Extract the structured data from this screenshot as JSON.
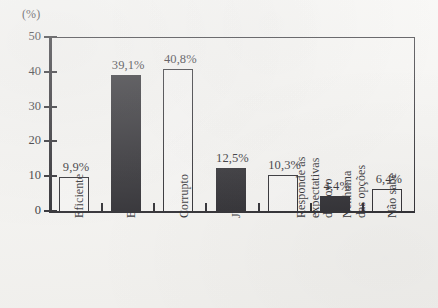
{
  "chart_data": {
    "type": "bar",
    "title": "",
    "xlabel": "",
    "ylabel": "(%)",
    "ylim": [
      0,
      50
    ],
    "yticks": [
      0,
      10,
      20,
      30,
      40,
      50
    ],
    "grid": false,
    "legend": null,
    "categories": [
      "Eficiente",
      "Burocrático",
      "Corrupto",
      "Justo",
      "Responde às expectativas do povo",
      "Nenhuma das opções",
      "Não sabe"
    ],
    "category_lines": [
      [
        "Eficiente"
      ],
      [
        "Burocrático"
      ],
      [
        "Corrupto"
      ],
      [
        "Justo"
      ],
      [
        "Responde às",
        "expectativas",
        "do povo"
      ],
      [
        "Nenhuma",
        "das opções"
      ],
      [
        "Não sabe"
      ]
    ],
    "values": [
      9.9,
      39.1,
      40.8,
      12.5,
      10.3,
      4.4,
      6.4
    ],
    "value_labels": [
      "9,9%",
      "39,1%",
      "40,8%",
      "12,5%",
      "10,3%",
      "4,4%",
      "6,4%"
    ],
    "bar_fills": [
      "white",
      "black",
      "white",
      "black",
      "white",
      "black",
      "white"
    ],
    "colors": {
      "bar_black": "#16151a",
      "bar_white": "#f7f6f4",
      "axis": "#16151a",
      "background": "#f5f4f1"
    }
  },
  "axis": {
    "unit_label": "(%)",
    "ytick_labels": [
      "0",
      "10",
      "20",
      "30",
      "40",
      "50"
    ]
  }
}
